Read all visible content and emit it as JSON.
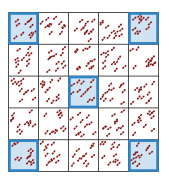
{
  "diagram": {
    "rows": 5,
    "cols": 5,
    "grid_line_color": "#222222",
    "highlight_fill": "#cfe3f2",
    "highlight_stroke": "#2f86c8",
    "dot_color": "#8b1a1a",
    "highlighted_cells": [
      {
        "row": 0,
        "col": 0
      },
      {
        "row": 0,
        "col": 4
      },
      {
        "row": 2,
        "col": 2
      },
      {
        "row": 4,
        "col": 0
      },
      {
        "row": 4,
        "col": 4
      }
    ],
    "dots_per_cell": 11
  }
}
